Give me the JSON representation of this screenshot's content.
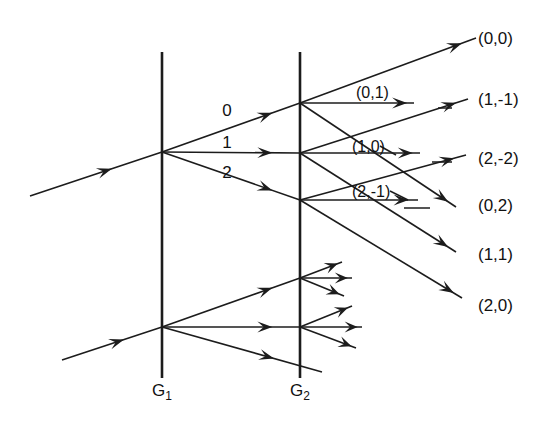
{
  "figure": {
    "name": "double-grating-diffraction-orders-diagram",
    "background_color": "#ffffff",
    "ink_color": "#1c1c1c",
    "width": 558,
    "height": 427
  },
  "gratings": [
    {
      "id": "g1",
      "label": "G",
      "subscript": "1",
      "x": 162,
      "y_top": 52,
      "y_bottom": 378,
      "label_x": 162,
      "label_y": 396
    },
    {
      "id": "g2",
      "label": "G",
      "subscript": "2",
      "x": 300,
      "y_top": 52,
      "y_bottom": 378,
      "label_x": 300,
      "label_y": 396
    }
  ],
  "order_labels_at_g1": [
    {
      "text": "0",
      "x": 227,
      "y": 116
    },
    {
      "text": "1",
      "x": 227,
      "y": 148
    },
    {
      "text": "2",
      "x": 227,
      "y": 178
    }
  ],
  "inline_labels": [
    {
      "text": "(0,1)",
      "x": 356,
      "y": 98
    },
    {
      "text": "(1,0)",
      "x": 352,
      "y": 152
    },
    {
      "text": "(2,-1)",
      "x": 352,
      "y": 197
    }
  ],
  "output_labels": [
    {
      "text": "(0,0)",
      "x": 478,
      "y": 44
    },
    {
      "text": "(1,-1)",
      "x": 478,
      "y": 105
    },
    {
      "text": "(2,-2)",
      "x": 478,
      "y": 164
    },
    {
      "text": "(0,2)",
      "x": 478,
      "y": 211
    },
    {
      "text": "(1,1)",
      "x": 478,
      "y": 260
    },
    {
      "text": "(2,0)",
      "x": 478,
      "y": 311
    }
  ],
  "incoming_beams": [
    {
      "id": "upper-input",
      "x1": 30,
      "y1": 196,
      "x2": 162,
      "y2": 152,
      "arrow_t": 0.62
    },
    {
      "id": "lower-input",
      "x1": 62,
      "y1": 360,
      "x2": 162,
      "y2": 327,
      "arrow_t": 0.62
    }
  ],
  "g1_upper_fan": [
    {
      "id": "upper-order-0",
      "x1": 162,
      "y1": 152,
      "x2": 300,
      "y2": 103,
      "arrow_t": 0.8
    },
    {
      "id": "upper-order-1",
      "x1": 162,
      "y1": 152,
      "x2": 300,
      "y2": 153,
      "arrow_t": 0.8
    },
    {
      "id": "upper-order-2",
      "x1": 162,
      "y1": 152,
      "x2": 300,
      "y2": 200,
      "arrow_t": 0.8
    }
  ],
  "g1_lower_fan": [
    {
      "id": "lower-order-0",
      "x1": 162,
      "y1": 327,
      "x2": 300,
      "y2": 278,
      "arrow_t": 0.8
    },
    {
      "id": "lower-order-1",
      "x1": 162,
      "y1": 327,
      "x2": 300,
      "y2": 327,
      "arrow_t": 0.8
    },
    {
      "id": "lower-order-2",
      "x1": 162,
      "y1": 327,
      "x2": 322,
      "y2": 372,
      "arrow_t": 0.7
    }
  ],
  "g2_upper_node_rays": [
    {
      "id": "ray-00",
      "x1": 300,
      "y1": 103,
      "x2": 476,
      "y2": 38,
      "arrow_t": 0.92
    },
    {
      "id": "ray-01",
      "x1": 300,
      "y1": 103,
      "x2": 414,
      "y2": 103,
      "arrow_t": 0.94
    },
    {
      "id": "ray-02",
      "x1": 300,
      "y1": 103,
      "x2": 456,
      "y2": 207,
      "arrow_t": 0.95
    }
  ],
  "g2_mid_node_rays": [
    {
      "id": "ray-1m1",
      "x1": 300,
      "y1": 153,
      "x2": 468,
      "y2": 99,
      "arrow_t": 0.93
    },
    {
      "id": "ray-10",
      "x1": 300,
      "y1": 153,
      "x2": 420,
      "y2": 153,
      "arrow_t": 0.94
    },
    {
      "id": "ray-11",
      "x1": 300,
      "y1": 153,
      "x2": 456,
      "y2": 252,
      "arrow_t": 0.95
    }
  ],
  "g2_low_node_rays": [
    {
      "id": "ray-2m2",
      "x1": 300,
      "y1": 200,
      "x2": 466,
      "y2": 155,
      "arrow_t": 0.93
    },
    {
      "id": "ray-2m1",
      "x1": 300,
      "y1": 200,
      "x2": 418,
      "y2": 200,
      "arrow_t": 0.92
    },
    {
      "id": "ray-20",
      "x1": 300,
      "y1": 200,
      "x2": 462,
      "y2": 298,
      "arrow_t": 0.95
    }
  ],
  "g2_lower_upper_node_rays": [
    {
      "id": "low-ray-a",
      "x1": 300,
      "y1": 278,
      "x2": 342,
      "y2": 262,
      "arrow_t": 0.9
    },
    {
      "id": "low-ray-b",
      "x1": 300,
      "y1": 278,
      "x2": 352,
      "y2": 278,
      "arrow_t": 0.92
    },
    {
      "id": "low-ray-c",
      "x1": 300,
      "y1": 278,
      "x2": 344,
      "y2": 296,
      "arrow_t": 0.9
    }
  ],
  "g2_lower_mid_node_rays": [
    {
      "id": "low-ray-d",
      "x1": 300,
      "y1": 327,
      "x2": 352,
      "y2": 306,
      "arrow_t": 0.92
    },
    {
      "id": "low-ray-e",
      "x1": 300,
      "y1": 327,
      "x2": 362,
      "y2": 327,
      "arrow_t": 0.93
    },
    {
      "id": "low-ray-f",
      "x1": 300,
      "y1": 327,
      "x2": 356,
      "y2": 348,
      "arrow_t": 0.92
    }
  ],
  "leaders": [
    {
      "id": "leader-1m1",
      "x1": 438,
      "y1": 108,
      "x2": 452,
      "y2": 108
    },
    {
      "id": "leader-10",
      "x1": 380,
      "y1": 146,
      "x2": 396,
      "y2": 155
    },
    {
      "id": "leader-2m2",
      "x1": 432,
      "y1": 162,
      "x2": 452,
      "y2": 162
    },
    {
      "id": "leader-2m1",
      "x1": 390,
      "y1": 191,
      "x2": 408,
      "y2": 200
    },
    {
      "id": "leader-11",
      "x1": 404,
      "y1": 208,
      "x2": 430,
      "y2": 208
    }
  ]
}
